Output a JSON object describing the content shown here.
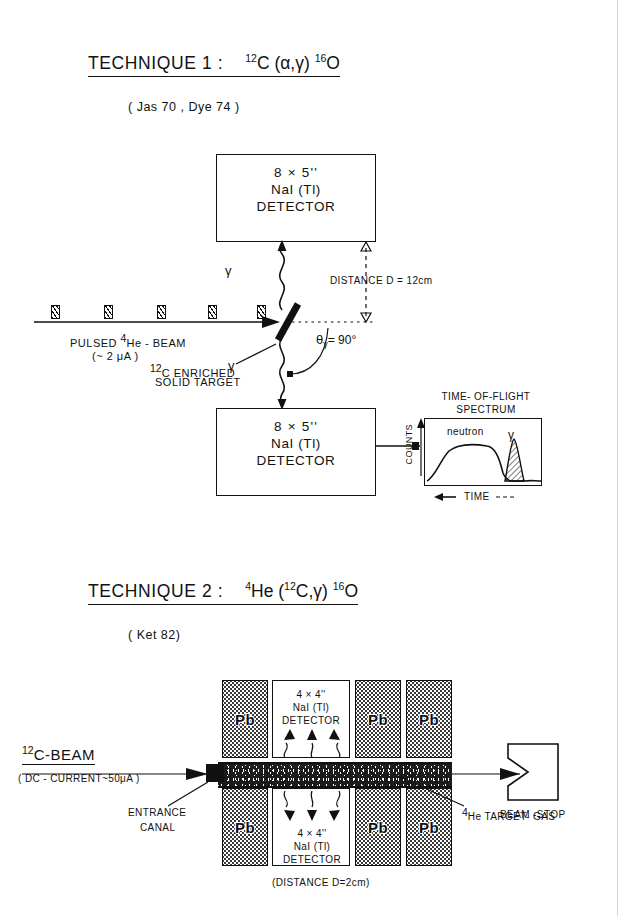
{
  "page": {
    "width": 621,
    "height": 916,
    "background": "#ffffff",
    "ink": "#111111"
  },
  "technique1": {
    "heading_label": "TECHNIQUE  1 :",
    "reaction": {
      "target_mass": "12",
      "target_symbol": "C",
      "open_paren": "(",
      "projectile": "α",
      "comma": ",",
      "ejectile": "γ",
      "close_paren": ")",
      "residual_mass": "16",
      "residual_symbol": "O",
      "full": "12C (α,γ) 16O"
    },
    "references": "( Jas 70 , Dye 74 )",
    "detector_top": {
      "size": "8 × 5''",
      "crystal": "NaI (Tl)",
      "kind": "DETECTOR"
    },
    "detector_bottom": {
      "size": "8 × 5''",
      "crystal": "NaI (Tl)",
      "kind": "DETECTOR"
    },
    "distance_label": "DISTANCE   D = 12cm",
    "beam_label": "PULSED  4He - BEAM",
    "beam_label_parts": {
      "prefix": "PULSED",
      "mass": "4",
      "symbol": "He - BEAM"
    },
    "beam_current": "(~ 2 μA )",
    "target_label_line1": "12C ENRICHED",
    "target_label_line2": "SOLID TARGET",
    "target_mass": "12",
    "target_text": "C ENRICHED",
    "gamma_symbol_up": "γ",
    "gamma_symbol_down": "γ",
    "angle_label": "= 90°",
    "angle_symbol": "θ",
    "angle_subscript": "γ",
    "collimator_count": 5,
    "spectrum": {
      "title_line1": "TIME- OF-FLIGHT",
      "title_line2": "SPECTRUM",
      "yaxis": "COUNTS",
      "xaxis": "TIME",
      "peak_broad": "neutron",
      "peak_narrow": "γ"
    }
  },
  "technique2": {
    "heading_label": "TECHNIQUE  2 :",
    "reaction": {
      "target_mass": "4",
      "target_symbol": "He",
      "open_paren": "(",
      "projectile_mass": "12",
      "projectile": "C",
      "comma": ",",
      "ejectile": "γ",
      "close_paren": ")",
      "residual_mass": "16",
      "residual_symbol": "O",
      "full": "4He (12C,γ) 16O"
    },
    "references": "( Ket 82)",
    "beam_label_mass": "12",
    "beam_label": "C-BEAM",
    "beam_current": "( DC - CURRENT~50μA )",
    "entrance_line1": "ENTRANCE",
    "entrance_line2": "CANAL",
    "target_gas_mass": "4",
    "target_gas_label": "He  TARGET- GAS",
    "beam_stop_label": "BEAM -STOP",
    "distance_label": "(DISTANCE  D=2cm)",
    "shield_label": "Pb",
    "shield_count_per_row": 3,
    "detector": {
      "size": "4 × 4''",
      "crystal": "NaI (Tl)",
      "kind": "DETECTOR"
    }
  }
}
